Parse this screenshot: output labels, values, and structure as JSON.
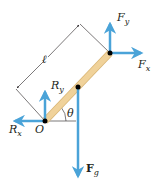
{
  "diagram": {
    "colors": {
      "arrow": "#4aa3d8",
      "rod": "#f0d29a",
      "rod_edge": "#d9b574",
      "line": "#231f20",
      "point": "#000000"
    },
    "labels": {
      "length": "ℓ",
      "pivot": "O",
      "angle": "θ",
      "Fy": {
        "main": "F",
        "sub": "y"
      },
      "Fx": {
        "main": "F",
        "sub": "x"
      },
      "Ry": {
        "main": "R",
        "sub": "y"
      },
      "Rx": {
        "main": "R",
        "sub": "x"
      },
      "Fg": {
        "main": "F",
        "sub": "g"
      }
    }
  }
}
